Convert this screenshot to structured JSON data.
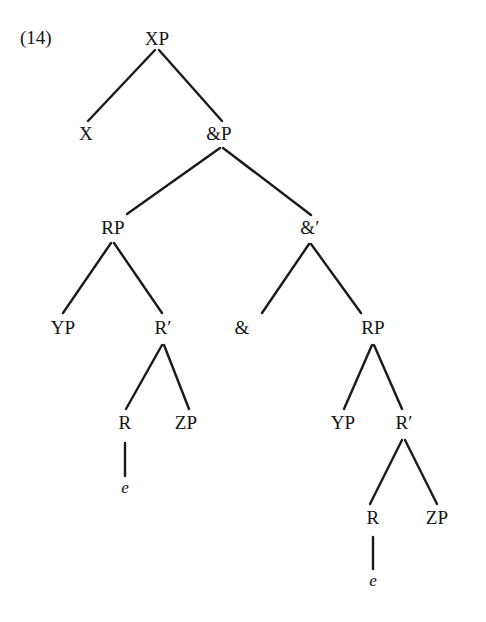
{
  "figure": {
    "example_number": "(14)",
    "ink_color": "#141414",
    "background_color": "#ffffff",
    "edge_color": "#1a1a1a",
    "nodes": [
      {
        "id": "xp",
        "label": "XP",
        "x": 157,
        "y": 38
      },
      {
        "id": "x",
        "label": "X",
        "x": 86,
        "y": 133
      },
      {
        "id": "andp",
        "label": "&P",
        "x": 219,
        "y": 133
      },
      {
        "id": "rp-left",
        "label": "RP",
        "x": 113,
        "y": 227
      },
      {
        "id": "andbar",
        "label": "&′",
        "x": 310,
        "y": 227
      },
      {
        "id": "yp-left",
        "label": "YP",
        "x": 63,
        "y": 327
      },
      {
        "id": "rbar-left",
        "label": "R′",
        "x": 163,
        "y": 327
      },
      {
        "id": "and",
        "label": "&",
        "x": 242,
        "y": 327
      },
      {
        "id": "rp-right",
        "label": "RP",
        "x": 373,
        "y": 327
      },
      {
        "id": "r-left",
        "label": "R",
        "x": 125,
        "y": 422
      },
      {
        "id": "zp-left",
        "label": "ZP",
        "x": 186,
        "y": 422
      },
      {
        "id": "yp-right",
        "label": "YP",
        "x": 343,
        "y": 422
      },
      {
        "id": "rbar-right",
        "label": "R′",
        "x": 404,
        "y": 422
      },
      {
        "id": "e-left",
        "label": "e",
        "x": 125,
        "y": 487,
        "style": "trace"
      },
      {
        "id": "r-right",
        "label": "R",
        "x": 373,
        "y": 517
      },
      {
        "id": "zp-right",
        "label": "ZP",
        "x": 437,
        "y": 517
      },
      {
        "id": "e-right",
        "label": "e",
        "x": 373,
        "y": 580,
        "style": "trace"
      }
    ],
    "edges": [
      {
        "id": "xp-to-x",
        "from": "xp",
        "to": "x",
        "x1": 155,
        "y1": 50,
        "x2": 88,
        "y2": 121
      },
      {
        "id": "xp-to-andp",
        "from": "xp",
        "to": "andp",
        "x1": 159,
        "y1": 50,
        "x2": 222,
        "y2": 121
      },
      {
        "id": "andp-to-rp-left",
        "from": "andp",
        "to": "rp-left",
        "x1": 220,
        "y1": 148,
        "x2": 127,
        "y2": 214
      },
      {
        "id": "andp-to-andbar",
        "from": "andp",
        "to": "andbar",
        "x1": 223,
        "y1": 148,
        "x2": 311,
        "y2": 215
      },
      {
        "id": "rp-left-to-yp",
        "from": "rp-left",
        "to": "yp-left",
        "x1": 111,
        "y1": 243,
        "x2": 63,
        "y2": 313
      },
      {
        "id": "rp-left-to-rbar",
        "from": "rp-left",
        "to": "rbar-left",
        "x1": 114,
        "y1": 243,
        "x2": 162,
        "y2": 313
      },
      {
        "id": "rbar-left-to-r",
        "from": "rbar-left",
        "to": "r-left",
        "x1": 162,
        "y1": 345,
        "x2": 126,
        "y2": 409
      },
      {
        "id": "rbar-left-to-zp",
        "from": "rbar-left",
        "to": "zp-left",
        "x1": 164,
        "y1": 345,
        "x2": 189,
        "y2": 409
      },
      {
        "id": "r-left-to-e",
        "from": "r-left",
        "to": "e-left",
        "x1": 125,
        "y1": 443,
        "x2": 125,
        "y2": 476
      },
      {
        "id": "andbar-to-and",
        "from": "andbar",
        "to": "and",
        "x1": 309,
        "y1": 244,
        "x2": 262,
        "y2": 313
      },
      {
        "id": "andbar-to-rp-right",
        "from": "andbar",
        "to": "rp-right",
        "x1": 311,
        "y1": 244,
        "x2": 361,
        "y2": 313
      },
      {
        "id": "rp-right-to-yp",
        "from": "rp-right",
        "to": "yp-right",
        "x1": 372,
        "y1": 345,
        "x2": 344,
        "y2": 409
      },
      {
        "id": "rp-right-to-rbar",
        "from": "rp-right",
        "to": "rbar-right",
        "x1": 374,
        "y1": 345,
        "x2": 402,
        "y2": 409
      },
      {
        "id": "rbar-right-to-r",
        "from": "rbar-right",
        "to": "r-right",
        "x1": 402,
        "y1": 440,
        "x2": 370,
        "y2": 504
      },
      {
        "id": "rbar-right-to-zp",
        "from": "rbar-right",
        "to": "zp-right",
        "x1": 405,
        "y1": 440,
        "x2": 437,
        "y2": 504
      },
      {
        "id": "r-right-to-e",
        "from": "r-right",
        "to": "e-right",
        "x1": 373,
        "y1": 537,
        "x2": 373,
        "y2": 569
      }
    ]
  }
}
